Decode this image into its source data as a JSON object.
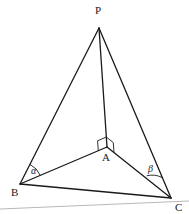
{
  "diagram": {
    "type": "tetrahedron",
    "points": {
      "P": {
        "label": "P",
        "x": 99,
        "y": 28
      },
      "A": {
        "label": "A",
        "x": 107,
        "y": 147
      },
      "B": {
        "label": "B",
        "x": 20,
        "y": 184
      },
      "C": {
        "label": "C",
        "x": 171,
        "y": 198
      }
    },
    "edges": [
      "PA",
      "PB",
      "PC",
      "AB",
      "AC",
      "BC"
    ],
    "angles": {
      "alpha": {
        "label": "α",
        "at": "B",
        "between": [
          "BP",
          "BA"
        ]
      },
      "beta": {
        "label": "β",
        "at": "C",
        "between": [
          "CP",
          "CA"
        ]
      }
    },
    "right_angle_marks": [
      {
        "at": "A",
        "between": [
          "AP",
          "AB"
        ]
      },
      {
        "at": "A",
        "between": [
          "AP",
          "AC"
        ]
      }
    ],
    "colors": {
      "stroke": "#1a1a1a",
      "baseline": "#b8b8b8"
    }
  }
}
